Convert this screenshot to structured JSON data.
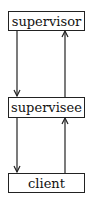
{
  "diagram": {
    "nodes": [
      {
        "id": "supervisor",
        "label": "supervisor"
      },
      {
        "id": "supervisee",
        "label": "supervisee"
      },
      {
        "id": "client",
        "label": "client"
      }
    ],
    "edges": [
      {
        "from": "supervisor",
        "to": "supervisee"
      },
      {
        "from": "supervisee",
        "to": "supervisor"
      },
      {
        "from": "supervisee",
        "to": "client"
      },
      {
        "from": "client",
        "to": "supervisee"
      }
    ]
  }
}
